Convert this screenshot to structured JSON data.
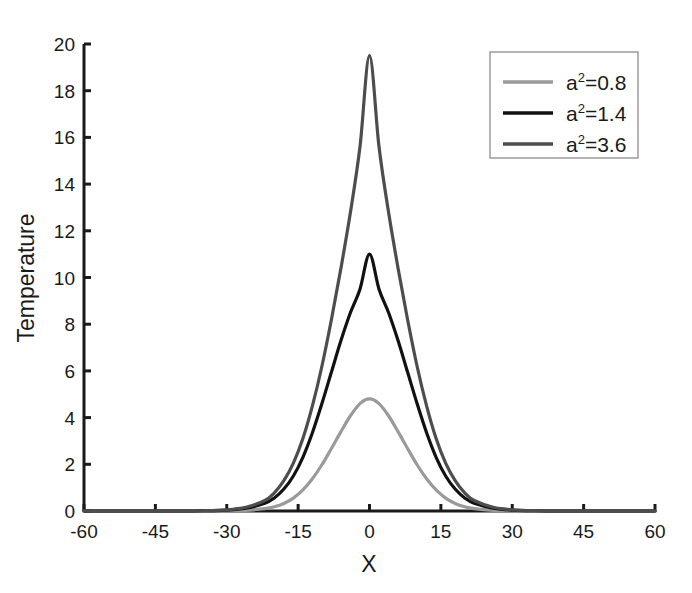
{
  "chart_data": {
    "type": "line",
    "title": "",
    "xlabel": "X",
    "ylabel": "Temperature",
    "xlim": [
      -60,
      60
    ],
    "ylim": [
      0,
      20
    ],
    "xticks": [
      -60,
      -45,
      -30,
      -15,
      0,
      15,
      30,
      45,
      60
    ],
    "xtick_labels": [
      "-60",
      "-45",
      "-30",
      "-15",
      "0",
      "15",
      "30",
      "45",
      "60"
    ],
    "yticks": [
      0,
      2,
      4,
      6,
      8,
      10,
      12,
      14,
      16,
      18,
      20
    ],
    "ytick_labels": [
      "0",
      "2",
      "4",
      "6",
      "8",
      "10",
      "12",
      "14",
      "16",
      "18",
      "20"
    ],
    "grid": false,
    "legend_position": "upper right",
    "series": [
      {
        "name": "a²=0.8",
        "base": "a",
        "exponent": "2",
        "suffix": "=0.8",
        "color": "#9a9a9a",
        "peak_x": 0,
        "peak_y": 4.8,
        "half_width": 7.0,
        "x": [
          -60,
          -55,
          -50,
          -45,
          -40,
          -35,
          -30,
          -26,
          -22,
          -20,
          -18,
          -16,
          -14,
          -12,
          -10,
          -8,
          -6,
          -4,
          -2,
          0,
          2,
          4,
          6,
          8,
          10,
          12,
          14,
          16,
          18,
          20,
          22,
          26,
          30,
          35,
          40,
          45,
          50,
          55,
          60
        ],
        "y": [
          0,
          0,
          0,
          0,
          0,
          0,
          0.01,
          0.03,
          0.1,
          0.18,
          0.32,
          0.55,
          0.9,
          1.38,
          1.98,
          2.68,
          3.4,
          4.08,
          4.6,
          4.8,
          4.6,
          4.08,
          3.4,
          2.68,
          1.98,
          1.38,
          0.9,
          0.55,
          0.32,
          0.18,
          0.1,
          0.03,
          0.01,
          0,
          0,
          0,
          0,
          0,
          0
        ]
      },
      {
        "name": "a²=1.4",
        "base": "a",
        "exponent": "2",
        "suffix": "=1.4",
        "color": "#111111",
        "peak_x": 0,
        "peak_y": 11.0,
        "half_width": 7.6,
        "x": [
          -60,
          -55,
          -50,
          -45,
          -40,
          -35,
          -30,
          -26,
          -22,
          -20,
          -18,
          -16,
          -14,
          -12,
          -10,
          -8,
          -6,
          -4,
          -2,
          0,
          2,
          4,
          6,
          8,
          10,
          12,
          14,
          16,
          18,
          20,
          22,
          26,
          30,
          35,
          40,
          45,
          50,
          55,
          60
        ],
        "y": [
          0,
          0,
          0,
          0,
          0,
          0.01,
          0.04,
          0.12,
          0.33,
          0.56,
          0.94,
          1.5,
          2.3,
          3.35,
          4.6,
          5.95,
          7.3,
          8.5,
          9.5,
          11.0,
          9.5,
          8.5,
          7.3,
          5.95,
          4.6,
          3.35,
          2.3,
          1.5,
          0.94,
          0.56,
          0.33,
          0.12,
          0.04,
          0.01,
          0,
          0,
          0,
          0,
          0
        ]
      },
      {
        "name": "a²=3.6",
        "base": "a",
        "exponent": "2",
        "suffix": "=3.6",
        "color": "#4d4d4d",
        "peak_x": 0,
        "peak_y": 19.5,
        "half_width": 7.2,
        "x": [
          -60,
          -55,
          -50,
          -45,
          -40,
          -35,
          -30,
          -26,
          -22,
          -20,
          -18,
          -16,
          -14,
          -12,
          -10,
          -8,
          -6,
          -4,
          -2,
          0,
          2,
          4,
          6,
          8,
          10,
          12,
          14,
          16,
          18,
          20,
          22,
          26,
          30,
          35,
          40,
          45,
          50,
          55,
          60
        ],
        "y": [
          0,
          0,
          0,
          0,
          0,
          0.01,
          0.05,
          0.16,
          0.45,
          0.78,
          1.3,
          2.05,
          3.1,
          4.5,
          6.2,
          8.2,
          10.4,
          12.8,
          15.6,
          19.5,
          15.6,
          12.8,
          10.4,
          8.2,
          6.2,
          4.5,
          3.1,
          2.05,
          1.3,
          0.78,
          0.45,
          0.16,
          0.05,
          0.01,
          0,
          0,
          0,
          0,
          0
        ]
      }
    ]
  },
  "axes": {
    "x_label": "X",
    "y_label": "Temperature",
    "axis_color": "#1a1a1a"
  },
  "legend": {
    "border_color": "#9a9a9a",
    "background": "#ffffff",
    "entries": [
      {
        "label": "a2=0.8",
        "base": "a",
        "exponent": "2",
        "suffix": "=0.8",
        "color": "#9a9a9a"
      },
      {
        "label": "a2=1.4",
        "base": "a",
        "exponent": "2",
        "suffix": "=1.4",
        "color": "#111111"
      },
      {
        "label": "a2=3.6",
        "base": "a",
        "exponent": "2",
        "suffix": "=3.6",
        "color": "#4d4d4d"
      }
    ]
  }
}
